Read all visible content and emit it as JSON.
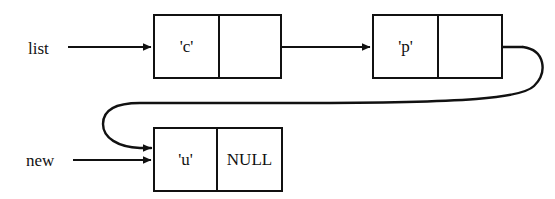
{
  "diagram": {
    "colors": {
      "stroke": "#111111",
      "background": "#ffffff",
      "text": "#111111"
    },
    "pointer_labels": [
      {
        "name": "list",
        "text": "list"
      },
      {
        "name": "new",
        "text": "new"
      }
    ],
    "nodes": [
      {
        "id": "node-c",
        "data": "'c'",
        "next": "",
        "next_is_null": false
      },
      {
        "id": "node-p",
        "data": "'p'",
        "next": "",
        "next_is_null": false
      },
      {
        "id": "node-u",
        "data": "'u'",
        "next": "NULL",
        "next_is_null": true
      }
    ],
    "edges": [
      {
        "name": "list-to-node-c",
        "from": "list",
        "to": "node-c",
        "style": "straight-arrow"
      },
      {
        "name": "node-c-to-node-p",
        "from": "node-c.next",
        "to": "node-p",
        "style": "straight-arrow"
      },
      {
        "name": "node-p-to-node-u",
        "from": "node-p.next",
        "to": "node-u",
        "style": "curved-loop-arrow"
      },
      {
        "name": "new-to-node-u",
        "from": "new",
        "to": "node-u",
        "style": "straight-arrow"
      }
    ]
  }
}
